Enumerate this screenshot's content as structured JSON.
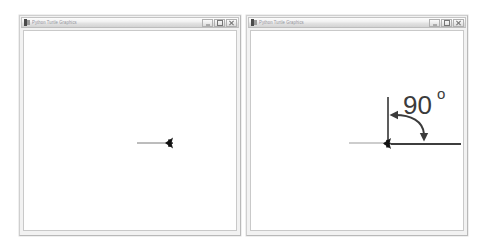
{
  "background_color": "#ffffff",
  "windows": [
    {
      "id": "left",
      "title": "Python Turtle Graphics",
      "icon_name": "python-turtle-icon",
      "controls": {
        "minimize_label": "Minimize",
        "maximize_label": "Maximize",
        "close_label": "Close"
      },
      "canvas": {
        "background_color": "#ffffff",
        "stroke_color": "#6f6f6f",
        "turtle_color": "#1a1a1a",
        "drawing_description": "A single short horizontal line drawn to the right with the turtle cursor resting at its right end.",
        "shapes": [
          {
            "kind": "line",
            "name": "forward-path-line",
            "x1": 113,
            "y1": 112,
            "x2": 145,
            "y2": 112,
            "color": "#7a7a7a",
            "width": 1
          },
          {
            "kind": "turtle",
            "name": "turtle-cursor",
            "x": 146,
            "y": 112,
            "heading_degrees": 0,
            "color": "#1a1a1a"
          }
        ]
      }
    },
    {
      "id": "right",
      "title": "Python Turtle Graphics",
      "icon_name": "python-turtle-icon",
      "controls": {
        "minimize_label": "Minimize",
        "maximize_label": "Maximize",
        "close_label": "Close"
      },
      "canvas": {
        "background_color": "#ffffff",
        "stroke_color": "#6f6f6f",
        "turtle_color": "#1a1a1a",
        "annotation_color": "#3b3b3b",
        "drawing_description": "A thin horizontal line arriving from the left, a vertical line going up from the turtle, a thicker horizontal line to the right, and a curved double-headed arrow marking a 90 degree right turn.",
        "angle_label": {
          "name": "angle-label",
          "value": "90",
          "unit_glyph": "o",
          "x": 158,
          "y": 72
        },
        "shapes": [
          {
            "kind": "line",
            "name": "incoming-path-line",
            "x1": 98,
            "y1": 112,
            "x2": 136,
            "y2": 112,
            "color": "#9b9b9b",
            "width": 1
          },
          {
            "kind": "line",
            "name": "vertical-heading-line",
            "x1": 137,
            "y1": 66,
            "x2": 137,
            "y2": 112,
            "color": "#5d5d5d",
            "width": 2
          },
          {
            "kind": "line",
            "name": "outgoing-path-line",
            "x1": 140,
            "y1": 113,
            "x2": 210,
            "y2": 113,
            "color": "#3d3d3d",
            "width": 2
          },
          {
            "kind": "curved-arrow",
            "name": "rotation-arrow",
            "start_x": 141,
            "start_y": 84,
            "end_x": 174,
            "end_y": 108,
            "arrowheads": [
              "start-left",
              "end-down"
            ],
            "color": "#3b3b3b",
            "width": 2
          },
          {
            "kind": "turtle",
            "name": "turtle-cursor",
            "x": 137,
            "y": 112,
            "heading_degrees": 0,
            "color": "#1a1a1a"
          }
        ]
      }
    }
  ]
}
